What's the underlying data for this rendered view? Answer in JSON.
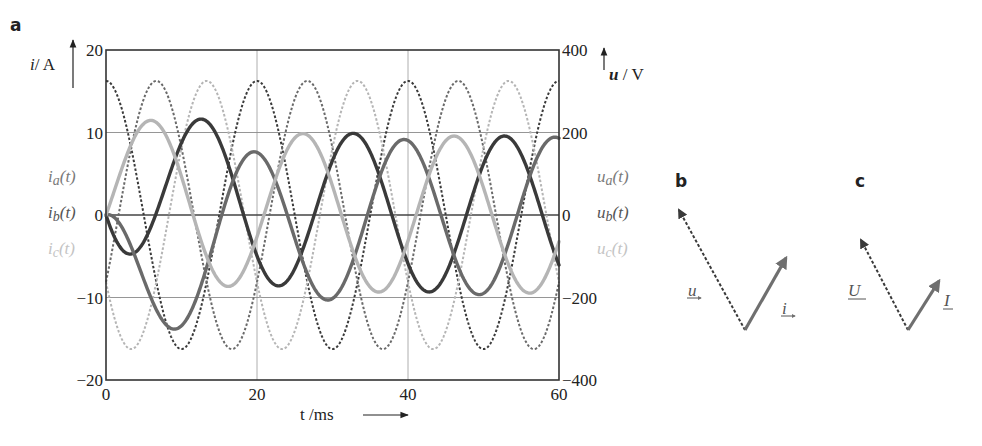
{
  "figure": {
    "panels": [
      {
        "id": "a",
        "label": "a"
      },
      {
        "id": "b",
        "label": "b"
      },
      {
        "id": "c",
        "label": "c"
      }
    ]
  },
  "chart_data": [
    {
      "panel": "a",
      "type": "line",
      "title": "",
      "xlabel": "t /ms",
      "ylabel_left": "i/ A",
      "ylabel_right": "u / V",
      "xlim": [
        0,
        60
      ],
      "ylim_left": [
        -20,
        20
      ],
      "ylim_right": [
        -400,
        400
      ],
      "xticks": [
        0,
        20,
        40,
        60
      ],
      "xtick_labels": [
        "0",
        "20",
        "40",
        "60"
      ],
      "yticks_left": [
        -20,
        -10,
        0,
        10,
        20
      ],
      "ytick_labels_left": [
        "−20",
        "−10",
        "0",
        "10",
        "20"
      ],
      "yticks_right": [
        -400,
        -200,
        0,
        200,
        400
      ],
      "ytick_labels_right": [
        "−400",
        "−200",
        "0",
        "200",
        "400"
      ],
      "grid": true,
      "legend_position": "inline labels beside left and right axes",
      "frequency_hz": 50,
      "series": [
        {
          "name": "u_a(t)",
          "label_display": "ua(t)",
          "kind": "voltage",
          "axis": "right",
          "style": "dashed",
          "color": "#3a3a3a",
          "amplitude": 325,
          "phase_deg": 90
        },
        {
          "name": "u_b(t)",
          "label_display": "ub(t)",
          "kind": "voltage",
          "axis": "right",
          "style": "dashed",
          "color": "#6a6a6a",
          "amplitude": 325,
          "phase_deg": -30
        },
        {
          "name": "u_c(t)",
          "label_display": "uc(t)",
          "kind": "voltage",
          "axis": "right",
          "style": "dashed",
          "color": "#b5b5b5",
          "amplitude": 325,
          "phase_deg": 210
        },
        {
          "name": "i_a(t)",
          "label_display": "ia(t)",
          "kind": "current",
          "axis": "left",
          "style": "solid",
          "color": "#3a3a3a",
          "steady_amplitude": 9.5,
          "peak_first": 12,
          "peak_first_t_ms": 8
        },
        {
          "name": "i_b(t)",
          "label_display": "ib(t)",
          "kind": "current",
          "axis": "left",
          "style": "solid",
          "color": "#6a6a6a",
          "steady_amplitude": 9.5,
          "peak_first": 4,
          "peak_first_t_ms": 2.5,
          "min_first": -10.5,
          "min_first_t_ms": 12
        },
        {
          "name": "i_c(t)",
          "label_display": "ic(t)",
          "kind": "current",
          "axis": "left",
          "style": "solid",
          "color": "#b5b5b5",
          "steady_amplitude": 9.5
        }
      ]
    },
    {
      "panel": "b",
      "type": "phasor",
      "vectors": [
        {
          "name": "u",
          "label_display": "u",
          "style": "dashed",
          "angle_deg": 120,
          "length_rel": 1.0,
          "color": "#3a3a3a"
        },
        {
          "name": "i",
          "label_display": "i",
          "style": "solid",
          "angle_deg": 60,
          "length_rel": 0.72,
          "color": "#6f6f6f"
        }
      ]
    },
    {
      "panel": "c",
      "type": "phasor",
      "vectors": [
        {
          "name": "U",
          "label_display": "U",
          "style": "dashed",
          "angle_deg": 120,
          "length_rel": 1.0,
          "color": "#3a3a3a"
        },
        {
          "name": "I",
          "label_display": "I",
          "style": "solid",
          "angle_deg": 60,
          "length_rel": 0.62,
          "color": "#6f6f6f"
        }
      ]
    }
  ]
}
